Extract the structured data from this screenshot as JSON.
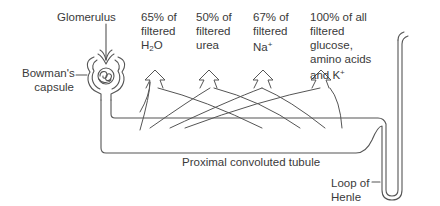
{
  "diagram": {
    "labels": {
      "glomerulus": "Glomerulus",
      "bowmans_capsule_line1": "Bowman's",
      "bowmans_capsule_line2": "capsule",
      "proximal_tubule": "Proximal convoluted tubule",
      "loop_line1": "Loop of",
      "loop_line2": "Henle"
    },
    "reabsorption": [
      {
        "line1": "65% of",
        "line2": "filtered",
        "line3_main": "H",
        "line3_sub": "2",
        "line3_rest": "O",
        "percent": 65,
        "substance": "H2O"
      },
      {
        "line1": "50% of",
        "line2": "filtered",
        "line3": "urea",
        "percent": 50,
        "substance": "urea"
      },
      {
        "line1": "67% of",
        "line2": "filtered",
        "line3_main": "Na",
        "line3_sup": "+",
        "percent": 67,
        "substance": "Na+"
      },
      {
        "line1": "100% of all",
        "line2": "filtered",
        "line3": "glucose,",
        "line4": "amino acids",
        "line5_main": "and K",
        "line5_sup": "+",
        "percent": 100,
        "substance": "glucose, amino acids and K+"
      }
    ],
    "colors": {
      "stroke": "#555555",
      "text": "#3a3a3a",
      "background": "#ffffff"
    }
  }
}
